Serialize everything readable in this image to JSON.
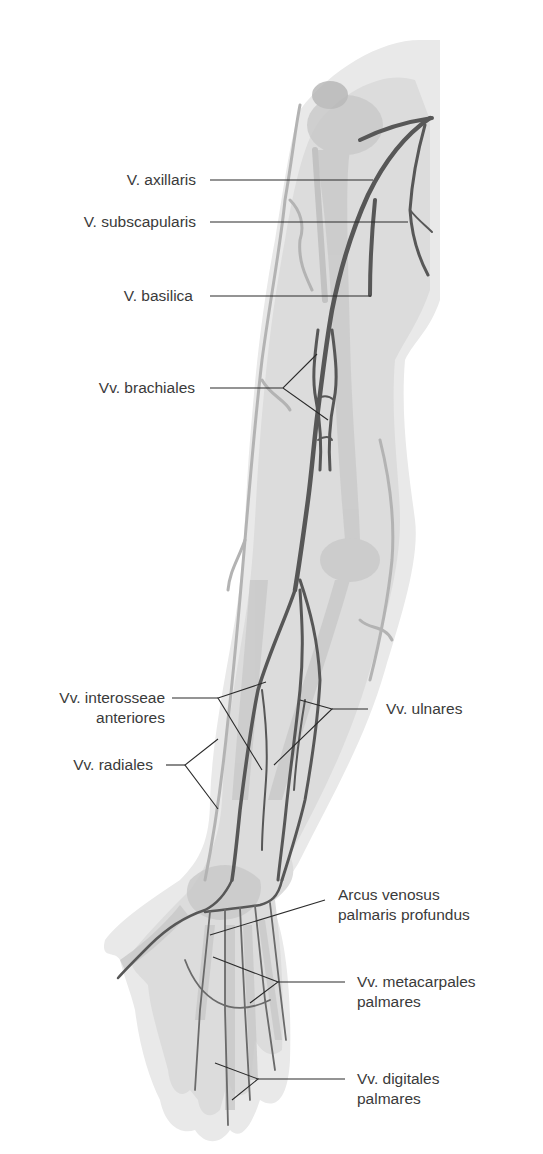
{
  "figure": {
    "colors": {
      "background": "#ffffff",
      "limb_outline": "#e6e6e6",
      "limb_fill": "#d9d9d9",
      "bone": "#c8c8c8",
      "superficial_vein": "#b3b3b3",
      "deep_vein": "#555555",
      "leader_line": "#2b2b2b",
      "label_text": "#3a3a3a"
    }
  },
  "labels": {
    "axillaris": {
      "line1": "V. axillaris"
    },
    "subscapularis": {
      "line1": "V. subscapularis"
    },
    "basilica": {
      "line1": "V. basilica"
    },
    "brachiales": {
      "line1": "Vv. brachiales"
    },
    "interosseae": {
      "line1": "Vv. interosseae",
      "line2": "anteriores"
    },
    "radiales": {
      "line1": "Vv. radiales"
    },
    "ulnares": {
      "line1": "Vv. ulnares"
    },
    "arcus": {
      "line1": "Arcus venosus",
      "line2": "palmaris profundus"
    },
    "metacarpales": {
      "line1": "Vv. metacarpales",
      "line2": "palmares"
    },
    "digitales": {
      "line1": "Vv. digitales",
      "line2": "palmares"
    }
  }
}
